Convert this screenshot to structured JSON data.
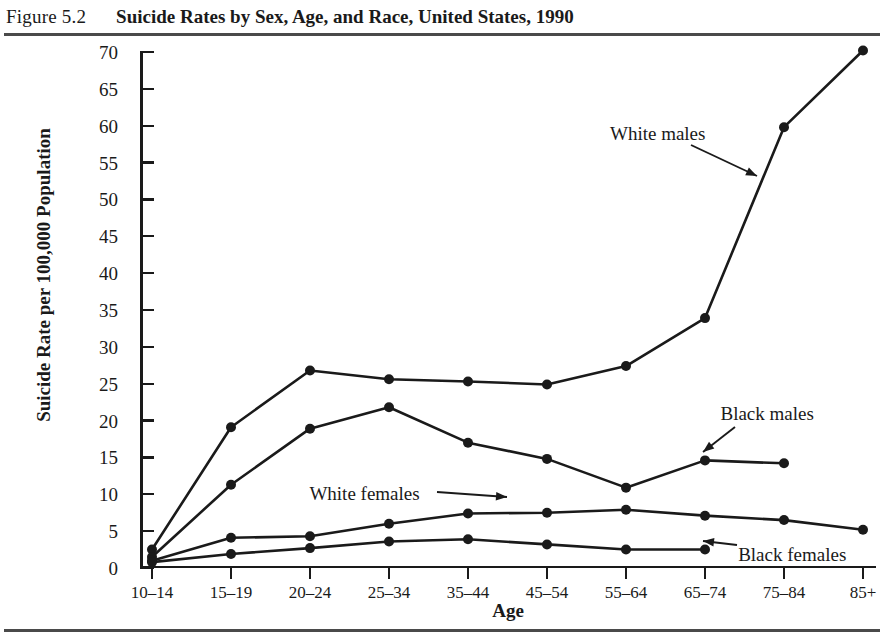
{
  "figure": {
    "number": "Figure 5.2",
    "title": "Suicide Rates by Sex, Age, and Race, United States, 1990"
  },
  "chart_data": {
    "type": "line",
    "title": "Suicide Rates by Sex, Age, and Race, United States, 1990",
    "xlabel": "Age",
    "ylabel": "Suicide Rate per 100,000 Population",
    "categories": [
      "10–14",
      "15–19",
      "20–24",
      "25–34",
      "35–44",
      "45–54",
      "55–64",
      "65–74",
      "75–84",
      "85+"
    ],
    "ylim": [
      0,
      70
    ],
    "yticks": [
      0,
      5,
      10,
      15,
      20,
      25,
      30,
      35,
      40,
      45,
      50,
      55,
      60,
      65,
      70
    ],
    "grid": false,
    "legend_position": "inline-annotations",
    "series": [
      {
        "name": "White males",
        "values": [
          2.5,
          19.1,
          26.8,
          25.6,
          25.3,
          24.9,
          27.4,
          33.9,
          59.8,
          70.2
        ]
      },
      {
        "name": "Black males",
        "values": [
          1.5,
          11.3,
          18.9,
          21.8,
          17.0,
          14.8,
          10.9,
          14.6,
          14.2,
          null
        ]
      },
      {
        "name": "White females",
        "values": [
          1.0,
          4.1,
          4.3,
          6.0,
          7.4,
          7.5,
          7.9,
          7.1,
          6.5,
          5.2
        ]
      },
      {
        "name": "Black females",
        "values": [
          0.8,
          1.9,
          2.7,
          3.6,
          3.9,
          3.2,
          2.5,
          2.5,
          null,
          null
        ]
      }
    ],
    "annotations": [
      {
        "label": "White males",
        "x_pct": 69.0,
        "y_pct": 19.5
      },
      {
        "label": "Black males",
        "x_pct": 81.5,
        "y_pct": 63.5
      },
      {
        "label": "White females",
        "x_pct": 35.0,
        "y_pct": 76.0
      },
      {
        "label": "Black females",
        "x_pct": 83.5,
        "y_pct": 85.5
      }
    ]
  },
  "colors": {
    "ink": "#1a1a1a",
    "rule": "#4a4a4a",
    "background": "#ffffff"
  }
}
